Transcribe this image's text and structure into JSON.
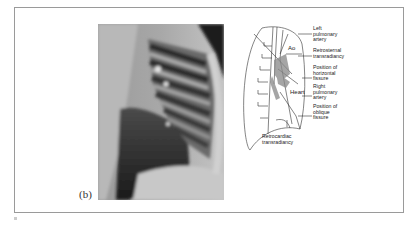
{
  "figure": {
    "panel_label": "(b)",
    "xray": {
      "description": "lateral chest radiograph",
      "colors": {
        "light": "#d8d8d8",
        "mid": "#8a8a8a",
        "dark": "#1e1e1e"
      }
    },
    "diagram": {
      "inner_labels": {
        "aorta": "Ao",
        "heart": "Heart"
      },
      "callouts": [
        {
          "id": "left-pulmonary-artery",
          "text": "Left\npulmonary\nartery"
        },
        {
          "id": "retrosternal-transradiancy",
          "text": "Retrosternal\ntransradiancy"
        },
        {
          "id": "horizontal-fissure",
          "text": "Position of\nhorizontal\nfissure"
        },
        {
          "id": "right-pulmonary-artery",
          "text": "Right\npulmonary\nartery"
        },
        {
          "id": "oblique-fissure",
          "text": "Position of\noblique\nfissure"
        },
        {
          "id": "retrocardiac-transradiancy",
          "text": "Retrocardiac\ntransradiancy"
        }
      ]
    }
  }
}
